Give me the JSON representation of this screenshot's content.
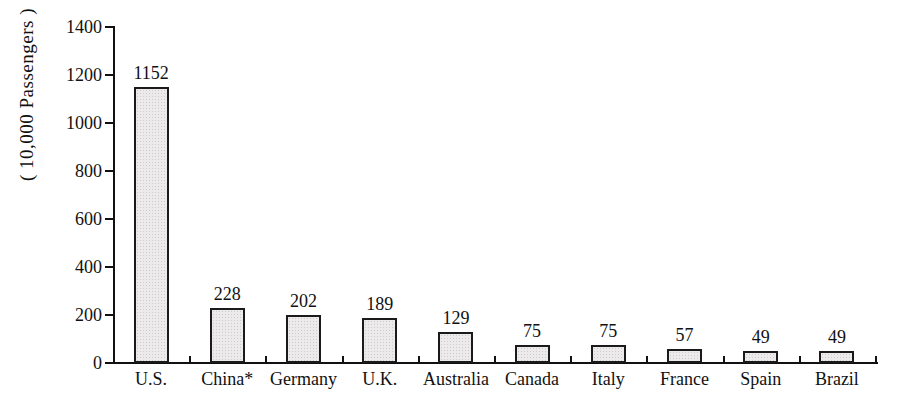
{
  "chart_data": {
    "type": "bar",
    "title": "",
    "subtitle": "",
    "xlabel": "",
    "ylabel": "( 10,000 Passengers )",
    "categories": [
      "U.S.",
      "China*",
      "Germany",
      "U.K.",
      "Australia",
      "Canada",
      "Italy",
      "France",
      "Spain",
      "Brazil"
    ],
    "values": [
      1152,
      228,
      202,
      189,
      129,
      75,
      75,
      57,
      49,
      49
    ],
    "value_labels": [
      "1152",
      "228",
      "202",
      "189",
      "129",
      "75",
      "75",
      "57",
      "49",
      "49"
    ],
    "ylim": [
      0,
      1400
    ],
    "y_ticks": [
      0,
      200,
      400,
      600,
      800,
      1000,
      1200,
      1400
    ],
    "y_tick_labels": [
      "0",
      "200",
      "400",
      "600",
      "800",
      "1000",
      "1200",
      "1400"
    ],
    "grid": false,
    "legend": false,
    "legend_position": "none",
    "bar_fill_color": "#eceaea",
    "bar_edge_color": "#1a1a1a",
    "axis_color": "#111111",
    "background_color": "#ffffff",
    "text_color": "#111111",
    "footnote": "",
    "annotations": []
  }
}
